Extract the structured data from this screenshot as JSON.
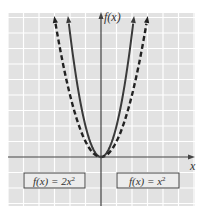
{
  "chart_data": {
    "type": "line",
    "title": "",
    "xlabel": "x",
    "ylabel": "f(x)",
    "xlim": [
      -6,
      6
    ],
    "ylim": [
      -3,
      9.3
    ],
    "grid": true,
    "grid_step": 1,
    "tick_labels": false,
    "series": [
      {
        "name": "f(x) = 2x^2",
        "style": "solid",
        "x": [
          -2.12,
          -2,
          -1.5,
          -1,
          -0.5,
          0,
          0.5,
          1,
          1.5,
          2,
          2.12
        ],
        "y": [
          9,
          8,
          4.5,
          2,
          0.5,
          0,
          0.5,
          2,
          4.5,
          8,
          9
        ]
      },
      {
        "name": "f(x) = x^2",
        "style": "dashed",
        "x": [
          -3,
          -2.5,
          -2,
          -1.5,
          -1,
          -0.5,
          0,
          0.5,
          1,
          1.5,
          2,
          2.5,
          3
        ],
        "y": [
          9,
          6.25,
          4,
          2.25,
          1,
          0.25,
          0,
          0.25,
          1,
          2.25,
          4,
          6.25,
          9
        ]
      }
    ],
    "legend": [
      {
        "label_left": "f(x) = 2x",
        "sup": "2",
        "position": "lower-left"
      },
      {
        "label_left": "f(x) = x",
        "sup": "2",
        "position": "lower-right"
      }
    ]
  },
  "labels": {
    "y_axis": "f(x)",
    "x_axis": "x",
    "box_left_main": "f(x) = 2x",
    "box_left_sup": "2",
    "box_right_main": "f(x) = x",
    "box_right_sup": "2"
  },
  "colors": {
    "grid_bg": "#e2e2e2",
    "grid_line": "#ffffff",
    "axis": "#444444",
    "curve": "#3a3a3a",
    "box_fill": "#ececec",
    "box_stroke": "#444444"
  }
}
